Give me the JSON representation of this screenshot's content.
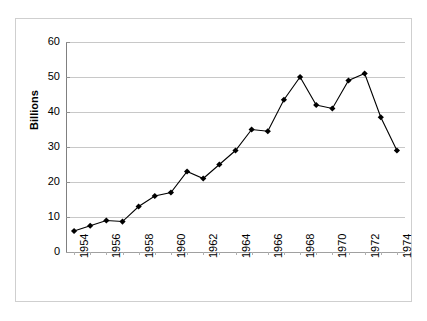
{
  "chart_data": {
    "type": "line",
    "title": "",
    "xlabel": "",
    "ylabel": "Billions",
    "ylim": [
      0,
      60
    ],
    "ytick_values": [
      0,
      10,
      20,
      30,
      40,
      50,
      60
    ],
    "ytick_labels": [
      "0",
      "10",
      "20",
      "30",
      "40",
      "50",
      "60"
    ],
    "grid": true,
    "legend": "none",
    "marker": "diamond",
    "line_color": "#000000",
    "marker_color": "#000000",
    "gridline_color": "#c8c8c8",
    "xtick_labels": [
      "1954",
      "1956",
      "1958",
      "1960",
      "1962",
      "1964",
      "1966",
      "1968",
      "1970",
      "1972",
      "1974"
    ],
    "x": [
      1954,
      1955,
      1956,
      1957,
      1958,
      1959,
      1960,
      1961,
      1962,
      1963,
      1964,
      1965,
      1966,
      1967,
      1968,
      1969,
      1970,
      1971,
      1972,
      1973,
      1974
    ],
    "values": [
      6,
      7.5,
      9,
      8.7,
      13,
      16,
      17,
      23,
      21,
      25,
      29,
      35,
      34.5,
      43.5,
      50,
      42,
      41,
      49,
      51,
      38.5,
      29
    ],
    "series": [
      {
        "name": "Billions",
        "values": [
          6,
          7.5,
          9,
          8.7,
          13,
          16,
          17,
          23,
          21,
          25,
          29,
          35,
          34.5,
          43.5,
          50,
          42,
          41,
          49,
          51,
          38.5,
          29
        ]
      }
    ]
  }
}
